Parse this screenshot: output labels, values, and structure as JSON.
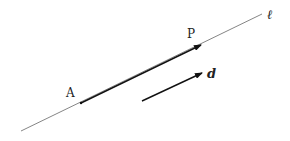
{
  "diagram": {
    "line": {
      "label": "ℓ",
      "start": [
        21,
        131
      ],
      "end": [
        262,
        14
      ],
      "color": "#666666"
    },
    "segment_AP": {
      "from": [
        81,
        103
      ],
      "to": [
        201,
        45
      ],
      "color": "#111111"
    },
    "point_A": {
      "label": "A",
      "pos": [
        81,
        103
      ]
    },
    "point_P": {
      "label": "P",
      "pos": [
        201,
        45
      ]
    },
    "vector_d": {
      "label": "d",
      "from": [
        142,
        101
      ],
      "to": [
        202,
        73
      ],
      "color": "#111111"
    }
  }
}
